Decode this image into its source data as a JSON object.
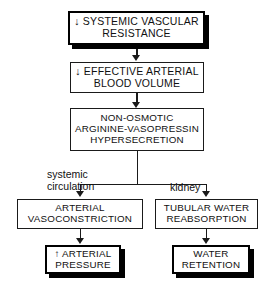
{
  "diagram": {
    "type": "flowchart",
    "background_color": "#ffffff",
    "line_color": "#1a1a1a",
    "text_color": "#111111",
    "nodes": [
      {
        "id": "systemic-vascular-resistance",
        "label": "↓ SYSTEMIC VASCULAR\nRESISTANCE",
        "emphasis": "shadowed"
      },
      {
        "id": "effective-arterial-blood-volume",
        "label": "↓ EFFECTIVE ARTERIAL\nBLOOD VOLUME",
        "emphasis": "plain"
      },
      {
        "id": "avp-hypersecretion",
        "label": "NON-OSMOTIC\nARGININE-VASOPRESSIN\nHYPERSECRETION",
        "emphasis": "plain"
      },
      {
        "id": "arterial-vasoconstriction",
        "label": "ARTERIAL\nVASOCONSTRICTION",
        "emphasis": "plain"
      },
      {
        "id": "tubular-water-reabsorption",
        "label": "TUBULAR WATER\nREABSORPTION",
        "emphasis": "plain"
      },
      {
        "id": "arterial-pressure",
        "label": "↑ ARTERIAL\nPRESSURE",
        "emphasis": "shadowed"
      },
      {
        "id": "water-retention",
        "label": "WATER\nRETENTION",
        "emphasis": "shadowed"
      }
    ],
    "branch_labels": [
      {
        "id": "systemic-circulation",
        "label": "systemic\ncirculation"
      },
      {
        "id": "kidney",
        "label": "kidney"
      }
    ]
  }
}
